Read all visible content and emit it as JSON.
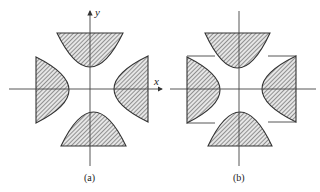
{
  "figure": {
    "panels": [
      {
        "id": "a",
        "caption": "(a)",
        "x_axis_label": "x",
        "y_axis_label": "y",
        "description": "Four hatched regions bounded by parabolic arcs opening outward along both axes"
      },
      {
        "id": "b",
        "caption": "(b)",
        "description": "Same four hatched regions with horizontal boundary segments extending from the left and right regions"
      }
    ],
    "fill_pattern": "diagonal-hatch",
    "colors": {
      "ink": "#333333",
      "hatch": "#555555",
      "background": "#ffffff"
    }
  }
}
